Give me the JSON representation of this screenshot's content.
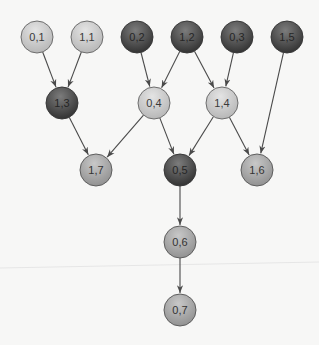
{
  "diagram": {
    "type": "directed-graph",
    "node_radius": 16,
    "colors": {
      "light": {
        "fill_top": "#e4e4e4",
        "fill_bottom": "#b4b4b4",
        "stroke": "#6e6e6e",
        "text": "#3a3a3a"
      },
      "medium": {
        "fill_top": "#c8c8c8",
        "fill_bottom": "#8e8e8e",
        "stroke": "#5e5e5e",
        "text": "#333333"
      },
      "dark": {
        "fill_top": "#7c7c7c",
        "fill_bottom": "#2e2e2e",
        "stroke": "#3a3a3a",
        "text": "#262626"
      },
      "edge": "#4a4a4a",
      "background": "#f7f7f6"
    },
    "nodes": [
      {
        "id": "n01",
        "label": "0,1",
        "x": 37,
        "y": 37,
        "shade": "light"
      },
      {
        "id": "n11",
        "label": "1,1",
        "x": 87,
        "y": 37,
        "shade": "light"
      },
      {
        "id": "n02",
        "label": "0,2",
        "x": 137,
        "y": 37,
        "shade": "dark"
      },
      {
        "id": "n12",
        "label": "1,2",
        "x": 187,
        "y": 37,
        "shade": "dark"
      },
      {
        "id": "n03",
        "label": "0,3",
        "x": 237,
        "y": 37,
        "shade": "dark"
      },
      {
        "id": "n15",
        "label": "1,5",
        "x": 287,
        "y": 37,
        "shade": "dark"
      },
      {
        "id": "n13",
        "label": "1,3",
        "x": 62,
        "y": 103,
        "shade": "dark"
      },
      {
        "id": "n04",
        "label": "0,4",
        "x": 154,
        "y": 103,
        "shade": "light"
      },
      {
        "id": "n14",
        "label": "1,4",
        "x": 222,
        "y": 103,
        "shade": "light"
      },
      {
        "id": "n17",
        "label": "1,7",
        "x": 96,
        "y": 170,
        "shade": "medium"
      },
      {
        "id": "n05",
        "label": "0,5",
        "x": 180,
        "y": 170,
        "shade": "dark"
      },
      {
        "id": "n16",
        "label": "1,6",
        "x": 257,
        "y": 170,
        "shade": "medium"
      },
      {
        "id": "n06",
        "label": "0,6",
        "x": 180,
        "y": 242,
        "shade": "medium"
      },
      {
        "id": "n07",
        "label": "0,7",
        "x": 180,
        "y": 310,
        "shade": "medium"
      }
    ],
    "edges": [
      {
        "from": "n01",
        "to": "n13"
      },
      {
        "from": "n11",
        "to": "n13"
      },
      {
        "from": "n02",
        "to": "n04"
      },
      {
        "from": "n12",
        "to": "n04"
      },
      {
        "from": "n12",
        "to": "n14"
      },
      {
        "from": "n03",
        "to": "n14"
      },
      {
        "from": "n15",
        "to": "n16"
      },
      {
        "from": "n13",
        "to": "n17"
      },
      {
        "from": "n04",
        "to": "n17"
      },
      {
        "from": "n04",
        "to": "n05"
      },
      {
        "from": "n14",
        "to": "n05"
      },
      {
        "from": "n14",
        "to": "n16"
      },
      {
        "from": "n05",
        "to": "n06"
      },
      {
        "from": "n06",
        "to": "n07"
      }
    ]
  }
}
